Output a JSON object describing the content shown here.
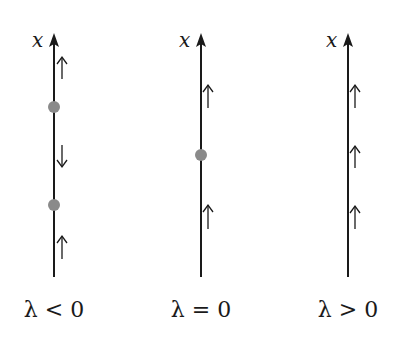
{
  "diagram": {
    "type": "phase-line bifurcation diagram",
    "axis_label": "x",
    "dot_color": "#8a8a8a",
    "line_color": "#1a1a1a",
    "panels": [
      {
        "caption": "λ < 0",
        "axis_label": "x",
        "fixed_points": 2,
        "flow": [
          "up",
          "down",
          "up"
        ]
      },
      {
        "caption": "λ = 0",
        "axis_label": "x",
        "fixed_points": 1,
        "flow": [
          "up",
          "up"
        ]
      },
      {
        "caption": "λ > 0",
        "axis_label": "x",
        "fixed_points": 0,
        "flow": [
          "up",
          "up",
          "up"
        ]
      }
    ]
  }
}
